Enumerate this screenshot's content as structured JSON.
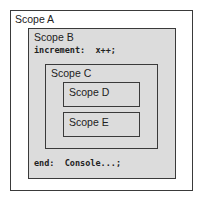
{
  "scopes": {
    "a": {
      "label": "Scope A"
    },
    "b": {
      "label": "Scope B",
      "line1": "increment:  x++;",
      "line2": "end:  Console...;"
    },
    "c": {
      "label": "Scope C"
    },
    "d": {
      "label": "Scope D"
    },
    "e": {
      "label": "Scope E"
    }
  },
  "colors": {
    "outer_fill": "#ffffff",
    "inner_fill": "#dcdcdc",
    "border": "#3a3a3a"
  }
}
